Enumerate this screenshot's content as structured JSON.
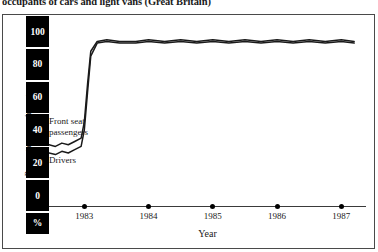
{
  "title": "occupants of cars and light vans (Great Britain)",
  "axes": {
    "ylabel": "Percentage wearing rate",
    "ypercent_symbol": "%",
    "yticks": [
      "100",
      "80",
      "60",
      "40",
      "20",
      "0"
    ],
    "xlabel": "Year",
    "xticks": [
      "1983",
      "1984",
      "1985",
      "1986",
      "1987"
    ]
  },
  "annotations": {
    "front_seat_passengers": "Front seat\npassengers",
    "front_seat_passengers_line1": "Front seat",
    "front_seat_passengers_line2": "passengers",
    "drivers": "Drivers"
  },
  "colors": {
    "strip": "#000000",
    "strip_text": "#ffffff",
    "line": "#1a1a1a",
    "frame": "#4a4a4a",
    "background": "#ffffff"
  },
  "chart_data": {
    "type": "line",
    "title": "occupants of cars and light vans (Great Britain)",
    "xlabel": "Year",
    "ylabel": "Percentage wearing rate",
    "ylim": [
      0,
      110
    ],
    "yticks": [
      0,
      20,
      40,
      60,
      80,
      100
    ],
    "xlim": [
      1982.45,
      1987.4
    ],
    "xticks": [
      1983,
      1984,
      1985,
      1986,
      1987
    ],
    "grid": false,
    "legend": "inline-annotations",
    "note": "Step change at the introduction of compulsory seat belt wearing, early 1983",
    "series": [
      {
        "name": "Front seat passengers",
        "x": [
          1982.45,
          1982.55,
          1982.65,
          1982.75,
          1982.85,
          1982.95,
          1983.0,
          1983.05,
          1983.1,
          1983.2,
          1983.35,
          1983.55,
          1983.8,
          1984.0,
          1984.25,
          1984.5,
          1984.75,
          1985.0,
          1985.25,
          1985.5,
          1985.75,
          1986.0,
          1986.25,
          1986.5,
          1986.75,
          1987.0,
          1987.2
        ],
        "values": [
          31,
          30,
          32,
          31,
          33,
          35,
          45,
          68,
          88,
          94,
          95,
          94,
          94,
          95,
          94,
          95,
          94,
          95,
          94,
          95,
          94,
          95,
          94,
          95,
          94,
          95,
          94
        ]
      },
      {
        "name": "Drivers",
        "x": [
          1982.45,
          1982.55,
          1982.65,
          1982.75,
          1982.85,
          1982.95,
          1983.0,
          1983.05,
          1983.1,
          1983.2,
          1983.35,
          1983.55,
          1983.8,
          1984.0,
          1984.25,
          1984.5,
          1984.75,
          1985.0,
          1985.25,
          1985.5,
          1985.75,
          1986.0,
          1986.25,
          1986.5,
          1986.75,
          1987.0,
          1987.2
        ],
        "values": [
          26,
          25,
          27,
          26,
          28,
          30,
          40,
          63,
          85,
          93,
          94,
          93,
          93,
          94,
          93,
          94,
          93,
          94,
          93,
          94,
          93,
          94,
          93,
          94,
          93,
          94,
          93
        ]
      }
    ]
  }
}
